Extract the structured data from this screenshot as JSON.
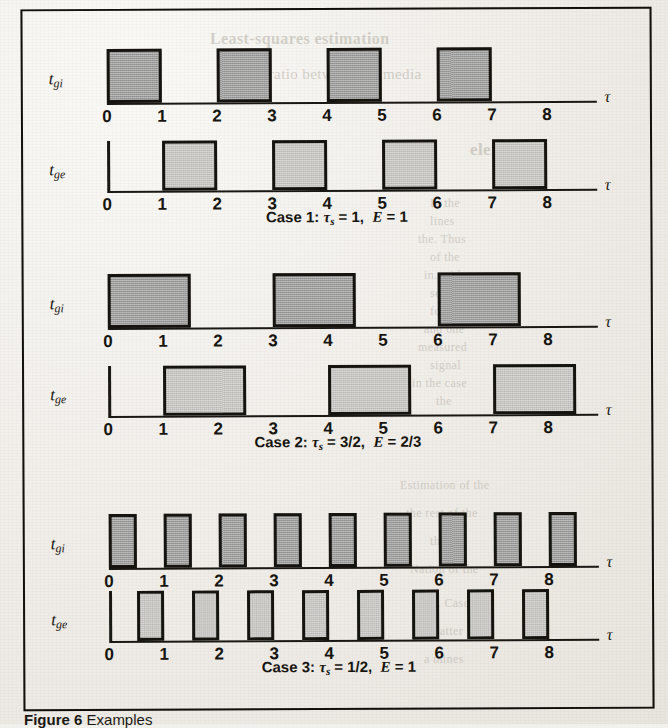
{
  "figure": {
    "caption_prefix": "Figure 6",
    "caption_rest": "Examples"
  },
  "axis": {
    "tau_symbol": "τ",
    "ticks": [
      "0",
      "1",
      "2",
      "3",
      "4",
      "5",
      "6",
      "7",
      "8"
    ],
    "x_min": 0,
    "x_max": 8.8
  },
  "labels": {
    "gi_base": "t",
    "gi_sub": "gi",
    "ge_base": "t",
    "ge_sub": "ge"
  },
  "colors": {
    "ink": "#16140f",
    "gi_fill": "#9d9d9b",
    "ge_fill": "#c8c7c3",
    "paper": "#efece7"
  },
  "cases": [
    {
      "id": "case-1",
      "caption_name": "Case 1:",
      "caption_tau": "τ",
      "caption_tau_sub": "s",
      "caption_tau_value": "= 1,",
      "caption_e": "E",
      "caption_e_value": "= 1",
      "tau_s": "1",
      "efficiency": "1"
    },
    {
      "id": "case-2",
      "caption_name": "Case 2:",
      "caption_tau": "τ",
      "caption_tau_sub": "s",
      "caption_tau_value": "= 3/2,",
      "caption_e": "E",
      "caption_e_value": "= 2/3",
      "tau_s": "3/2",
      "efficiency": "2/3"
    },
    {
      "id": "case-3",
      "caption_name": "Case 3:",
      "caption_tau": "τ",
      "caption_tau_sub": "s",
      "caption_tau_value": "= 1/2,",
      "caption_e": "E",
      "caption_e_value": "= 1",
      "tau_s": "1/2",
      "efficiency": "1"
    }
  ],
  "chart_data": {
    "type": "line",
    "xlabel": "τ",
    "ylabel": "",
    "xlim": [
      0,
      8.8
    ],
    "ylim": [
      0,
      1
    ],
    "grid": false,
    "legend": "none",
    "tick_labels": [
      "0",
      "1",
      "2",
      "3",
      "4",
      "5",
      "6",
      "7",
      "8"
    ],
    "series": [
      {
        "name": "Case 1 — t_gi",
        "case": "Case 1",
        "signal": "t_gi",
        "tau_s": 1,
        "efficiency": 1,
        "pulse_width": 1,
        "pulses": [
          [
            0,
            1
          ],
          [
            2,
            3
          ],
          [
            4,
            5
          ],
          [
            6,
            7
          ]
        ]
      },
      {
        "name": "Case 1 — t_ge",
        "case": "Case 1",
        "signal": "t_ge",
        "tau_s": 1,
        "efficiency": 1,
        "pulse_width": 1,
        "pulses": [
          [
            1,
            2
          ],
          [
            3,
            4
          ],
          [
            5,
            6
          ],
          [
            7,
            8
          ]
        ]
      },
      {
        "name": "Case 2 — t_gi",
        "case": "Case 2",
        "signal": "t_gi",
        "tau_s": 1.5,
        "efficiency": 0.6667,
        "pulse_width": 1.5,
        "pulses": [
          [
            0,
            1.5
          ],
          [
            3,
            4.5
          ],
          [
            6,
            7.5
          ]
        ]
      },
      {
        "name": "Case 2 — t_ge",
        "case": "Case 2",
        "signal": "t_ge",
        "tau_s": 1.5,
        "efficiency": 0.6667,
        "pulse_width": 1.5,
        "pulses": [
          [
            1,
            2.5
          ],
          [
            4,
            5.5
          ],
          [
            7,
            8.5
          ]
        ]
      },
      {
        "name": "Case 3 — t_gi",
        "case": "Case 3",
        "signal": "t_gi",
        "tau_s": 0.5,
        "efficiency": 1,
        "pulse_width": 0.5,
        "pulses": [
          [
            0,
            0.5
          ],
          [
            1,
            1.5
          ],
          [
            2,
            2.5
          ],
          [
            3,
            3.5
          ],
          [
            4,
            4.5
          ],
          [
            5,
            5.5
          ],
          [
            6,
            6.5
          ],
          [
            7,
            7.5
          ],
          [
            8,
            8.5
          ]
        ]
      },
      {
        "name": "Case 3 — t_ge",
        "case": "Case 3",
        "signal": "t_ge",
        "tau_s": 0.5,
        "efficiency": 1,
        "pulse_width": 0.5,
        "pulses": [
          [
            0.5,
            1
          ],
          [
            1.5,
            2
          ],
          [
            2.5,
            3
          ],
          [
            3.5,
            4
          ],
          [
            4.5,
            5
          ],
          [
            5.5,
            6
          ],
          [
            6.5,
            7
          ],
          [
            7.5,
            8
          ]
        ]
      }
    ]
  },
  "bleed_text": [
    {
      "t": "Least-squares estimation",
      "x": 210,
      "y": 30,
      "s": 16,
      "b": true
    },
    {
      "t": "the ratio between the media",
      "x": 245,
      "y": 66,
      "s": 15,
      "b": false
    },
    {
      "t": "elements",
      "x": 470,
      "y": 140,
      "s": 17,
      "b": true
    },
    {
      "t": "In the",
      "x": 430,
      "y": 196,
      "s": 12,
      "b": false
    },
    {
      "t": "lines",
      "x": 430,
      "y": 214,
      "s": 12,
      "b": false
    },
    {
      "t": "the. Thus",
      "x": 418,
      "y": 232,
      "s": 12,
      "b": false
    },
    {
      "t": "of the",
      "x": 430,
      "y": 250,
      "s": 12,
      "b": false
    },
    {
      "t": "in. with",
      "x": 424,
      "y": 268,
      "s": 12,
      "b": false
    },
    {
      "t": "section",
      "x": 430,
      "y": 286,
      "s": 12,
      "b": false
    },
    {
      "t": "for the",
      "x": 430,
      "y": 304,
      "s": 12,
      "b": false
    },
    {
      "t": "and one",
      "x": 424,
      "y": 322,
      "s": 12,
      "b": false
    },
    {
      "t": "measured",
      "x": 418,
      "y": 340,
      "s": 12,
      "b": false
    },
    {
      "t": "signal",
      "x": 430,
      "y": 358,
      "s": 12,
      "b": false
    },
    {
      "t": "in the case",
      "x": 412,
      "y": 376,
      "s": 12,
      "b": false
    },
    {
      "t": "the",
      "x": 436,
      "y": 394,
      "s": 12,
      "b": false
    },
    {
      "t": "Estimation of the",
      "x": 400,
      "y": 478,
      "s": 12,
      "b": false
    },
    {
      "t": "the rest of the",
      "x": 406,
      "y": 506,
      "s": 12,
      "b": false
    },
    {
      "t": "the",
      "x": 430,
      "y": 534,
      "s": 12,
      "b": false
    },
    {
      "t": "Nation of the",
      "x": 410,
      "y": 562,
      "s": 12,
      "b": false
    },
    {
      "t": "the 6. Case",
      "x": 412,
      "y": 596,
      "s": 12,
      "b": false
    },
    {
      "t": "matter",
      "x": 430,
      "y": 624,
      "s": 12,
      "b": false
    },
    {
      "t": "a mines",
      "x": 424,
      "y": 652,
      "s": 12,
      "b": false
    }
  ]
}
